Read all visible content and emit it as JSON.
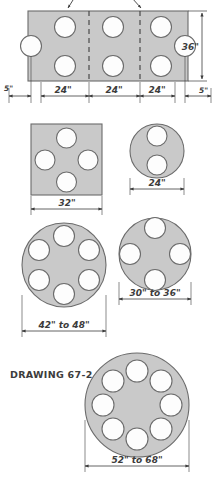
{
  "drawing": {
    "caption": "DRAWING 67-2",
    "colors": {
      "table_fill": "#c9c9c9",
      "table_stroke": "#6b6b6b",
      "seat_fill": "#fdfdfd",
      "seat_stroke": "#6b6b6b",
      "dimension": "#3c3c3c",
      "background": "#ffffff"
    }
  },
  "figures": [
    {
      "id": "rectangular-table",
      "shape": "rectangle",
      "seats": 8,
      "seat_layout": "3 top, 3 bottom, 1 left end, 1 right end",
      "dimensions": {
        "height_label": "36\"",
        "width_segments": [
          "5\"",
          "24\"",
          "24\"",
          "24\"",
          "5\""
        ]
      },
      "leader_arrows": 2,
      "section_lines": 2
    },
    {
      "id": "square-table",
      "shape": "square",
      "seats": 4,
      "seat_layout": "1 per side",
      "dimensions": {
        "width_label": "32\""
      }
    },
    {
      "id": "small-round-table",
      "shape": "circle",
      "seats": 2,
      "seat_layout": "top and bottom",
      "dimensions": {
        "diameter_label": "24\""
      }
    },
    {
      "id": "round-table-six",
      "shape": "circle",
      "seats": 6,
      "dimensions": {
        "diameter_label": "42\" to 48\""
      }
    },
    {
      "id": "round-table-four",
      "shape": "circle",
      "seats": 4,
      "dimensions": {
        "diameter_label": "30\" to 36\""
      }
    },
    {
      "id": "round-table-eight",
      "shape": "circle",
      "seats": 8,
      "dimensions": {
        "diameter_label": "52\" to 68\""
      }
    }
  ],
  "labels": {
    "rect_height": "36\"",
    "rect_left_margin": "5\"",
    "rect_seg_1": "24\"",
    "rect_seg_2": "24\"",
    "rect_seg_3": "24\"",
    "rect_right_margin": "5\"",
    "square_width": "32\"",
    "small_round_diameter": "24\"",
    "round_six_diameter": "42\" to 48\"",
    "round_four_diameter": "30\" to 36\"",
    "round_eight_diameter": "52\" to 68\"",
    "caption": "DRAWING 67-2"
  }
}
